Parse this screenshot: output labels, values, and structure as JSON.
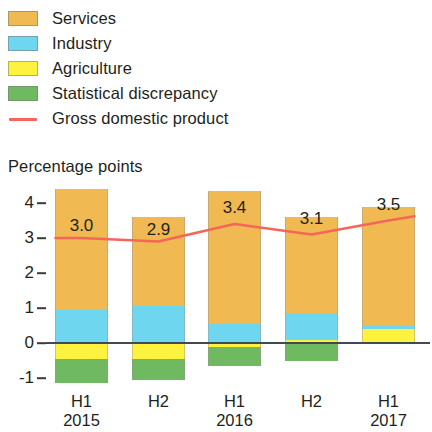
{
  "axis_title": "Percentage points",
  "legend": [
    {
      "name": "services",
      "label": "Services",
      "color": "#f0b951",
      "marker": "square"
    },
    {
      "name": "industry",
      "label": "Industry",
      "color": "#6fd6ef",
      "marker": "square"
    },
    {
      "name": "agriculture",
      "label": "Agriculture",
      "color": "#fdf33f",
      "marker": "square"
    },
    {
      "name": "statistical-discrepancy",
      "label": "Statistical discrepancy",
      "color": "#6fb960",
      "marker": "square"
    },
    {
      "name": "gross-domestic-product",
      "label": "Gross domestic product",
      "color": "#f4665a",
      "marker": "line"
    }
  ],
  "chart_data": {
    "type": "bar",
    "stacked": true,
    "title": "",
    "subtitle": "",
    "xlabel": "",
    "ylabel": "Percentage points",
    "ylim": [
      -1,
      4
    ],
    "yticks": [
      4,
      3,
      2,
      1,
      0,
      -1
    ],
    "ytick_labels": [
      "4",
      "3",
      "2",
      "1",
      "0",
      "-1"
    ],
    "grid": false,
    "legend_position": "top-left",
    "categories": [
      "H1",
      "H2",
      "H1",
      "H2",
      "H1"
    ],
    "category_years": [
      "2015",
      "",
      "2016",
      "",
      "2017"
    ],
    "series": [
      {
        "name": "Services",
        "color": "#f0b951",
        "values": [
          3.45,
          2.55,
          3.8,
          2.75,
          3.4
        ]
      },
      {
        "name": "Industry",
        "color": "#6fd6ef",
        "values": [
          0.95,
          1.05,
          0.55,
          0.75,
          0.1
        ]
      },
      {
        "name": "Agriculture",
        "color": "#fdf33f",
        "values": [
          -0.45,
          -0.45,
          -0.1,
          0.1,
          0.4
        ]
      },
      {
        "name": "Statistical discrepancy",
        "color": "#6fb960",
        "values": [
          -0.7,
          -0.6,
          -0.55,
          -0.5,
          0.0
        ]
      }
    ],
    "line_series": {
      "name": "Gross domestic product",
      "color": "#f4665a",
      "values": [
        3.0,
        2.9,
        3.4,
        3.1,
        3.5
      ],
      "labels": [
        "3.0",
        "2.9",
        "3.4",
        "3.1",
        "3.5"
      ]
    }
  }
}
